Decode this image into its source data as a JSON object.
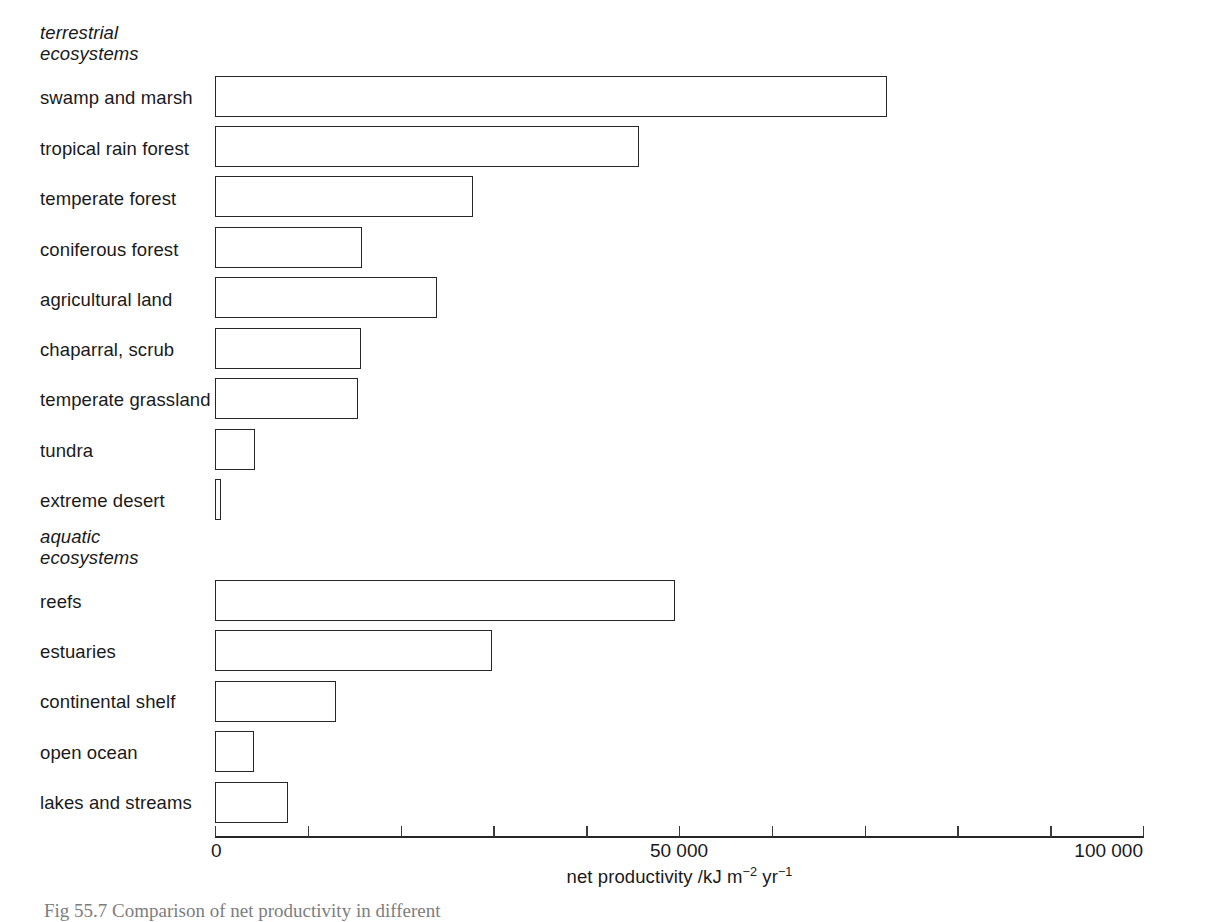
{
  "figure": {
    "caption": "Fig 55.7  Comparison of net productivity in different"
  },
  "groups": [
    {
      "id": "terrestrial",
      "label": "terrestrial\necosystems"
    },
    {
      "id": "aquatic",
      "label": "aquatic\necosystems"
    }
  ],
  "axis": {
    "title_main": "net productivity /kJ m",
    "title_sup1": "−2",
    "title_mid": " yr",
    "title_sup2": "−1",
    "ticks": [
      {
        "value": 0,
        "label": "0"
      },
      {
        "value": 10000,
        "label": ""
      },
      {
        "value": 20000,
        "label": ""
      },
      {
        "value": 30000,
        "label": ""
      },
      {
        "value": 40000,
        "label": ""
      },
      {
        "value": 50000,
        "label": "50 000"
      },
      {
        "value": 60000,
        "label": ""
      },
      {
        "value": 70000,
        "label": ""
      },
      {
        "value": 80000,
        "label": ""
      },
      {
        "value": 90000,
        "label": ""
      },
      {
        "value": 100000,
        "label": "100 000"
      }
    ]
  },
  "chart_data": {
    "type": "bar",
    "orientation": "horizontal",
    "title": "",
    "xlabel": "net productivity /kJ m−2 yr−1",
    "ylabel": "",
    "xlim": [
      0,
      100000
    ],
    "grid": false,
    "legend": "none",
    "categories": [
      "swamp and marsh",
      "tropical rain forest",
      "temperate forest",
      "coniferous forest",
      "agricultural land",
      "chaparral, scrub",
      "temperate grassland",
      "tundra",
      "extreme desert",
      "reefs",
      "estuaries",
      "continental shelf",
      "open ocean",
      "lakes and streams"
    ],
    "values": [
      72400,
      45700,
      27800,
      15800,
      23900,
      15700,
      15400,
      4300,
      650,
      49600,
      29800,
      13000,
      4200,
      7900
    ],
    "group_of_category": [
      "terrestrial",
      "terrestrial",
      "terrestrial",
      "terrestrial",
      "terrestrial",
      "terrestrial",
      "terrestrial",
      "terrestrial",
      "terrestrial",
      "aquatic",
      "aquatic",
      "aquatic",
      "aquatic",
      "aquatic"
    ]
  }
}
